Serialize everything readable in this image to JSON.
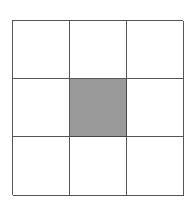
{
  "diagram": {
    "type": "grid",
    "rows": 3,
    "columns": 3,
    "shaded_cells": [
      [
        1,
        1
      ]
    ],
    "colors": {
      "line": "#555555",
      "shaded_fill": "#9a9a9a",
      "empty_fill": "#ffffff"
    },
    "cells": [
      {
        "row": 0,
        "col": 0,
        "shaded": false
      },
      {
        "row": 0,
        "col": 1,
        "shaded": false
      },
      {
        "row": 0,
        "col": 2,
        "shaded": false
      },
      {
        "row": 1,
        "col": 0,
        "shaded": false
      },
      {
        "row": 1,
        "col": 1,
        "shaded": true
      },
      {
        "row": 1,
        "col": 2,
        "shaded": false
      },
      {
        "row": 2,
        "col": 0,
        "shaded": false
      },
      {
        "row": 2,
        "col": 1,
        "shaded": false
      },
      {
        "row": 2,
        "col": 2,
        "shaded": false
      }
    ]
  }
}
